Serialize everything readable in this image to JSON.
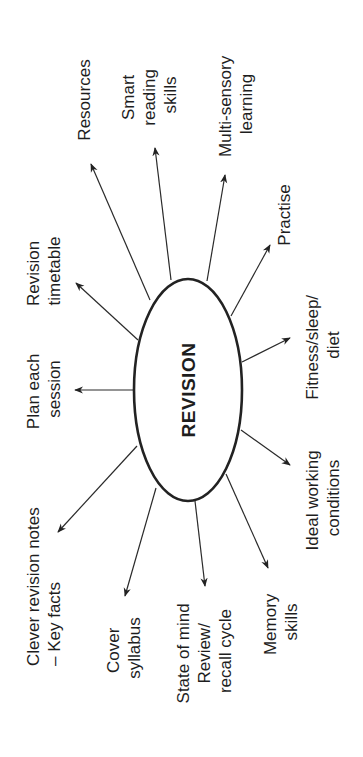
{
  "diagram": {
    "type": "mind-map",
    "orientation": "rotated-90-ccw",
    "center": {
      "label": "REVISION"
    },
    "branches": [
      {
        "id": "resources",
        "lines": [
          "Resources"
        ]
      },
      {
        "id": "smart-reading",
        "lines": [
          "Smart",
          "reading",
          "skills"
        ]
      },
      {
        "id": "multi-sensory",
        "lines": [
          "Multi-sensory",
          "learning"
        ]
      },
      {
        "id": "practise",
        "lines": [
          "Practise"
        ]
      },
      {
        "id": "fitness",
        "lines": [
          "Fitness/sleep/",
          "diet"
        ]
      },
      {
        "id": "ideal-working",
        "lines": [
          "Ideal working",
          "conditions"
        ]
      },
      {
        "id": "memory",
        "lines": [
          "Memory",
          "skills"
        ]
      },
      {
        "id": "state-of-mind",
        "lines": [
          "State of mind",
          "Review/",
          "recall cycle"
        ]
      },
      {
        "id": "cover-syllabus",
        "lines": [
          "Cover",
          "syllabus"
        ]
      },
      {
        "id": "clever-notes",
        "lines": [
          "Clever revision notes",
          "– Key facts"
        ]
      },
      {
        "id": "plan-session",
        "lines": [
          "Plan each",
          "session"
        ]
      },
      {
        "id": "revision-timetable",
        "lines": [
          "Revision",
          "timetable"
        ]
      }
    ],
    "colors": {
      "ink": "#1e1e1e",
      "background": "#ffffff"
    }
  }
}
